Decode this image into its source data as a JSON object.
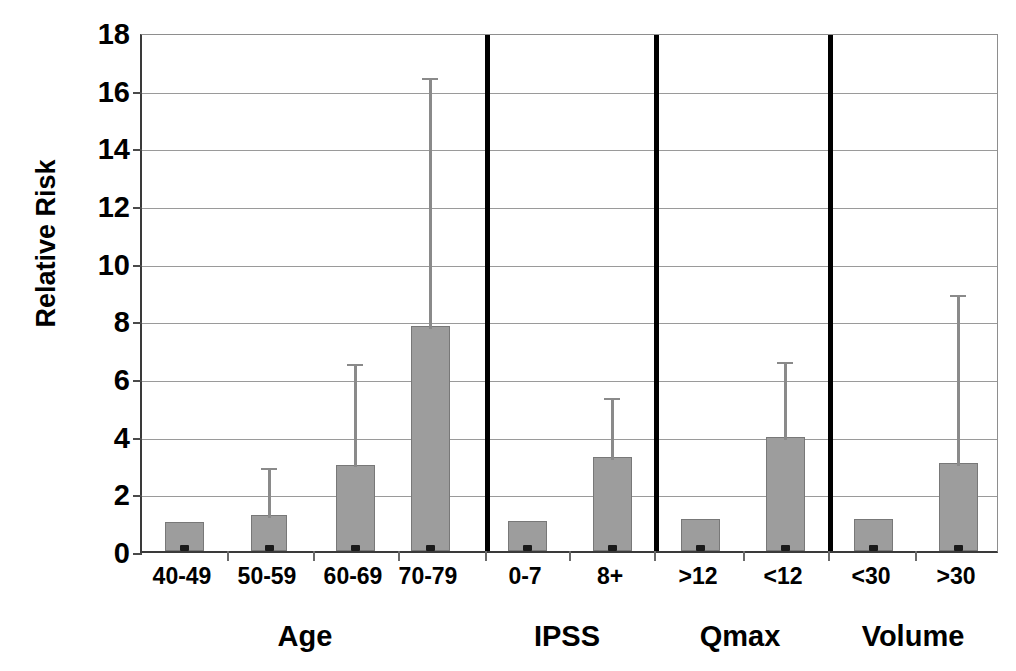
{
  "chart_data": {
    "type": "bar",
    "title": "",
    "subtitle": "",
    "xlabel": "",
    "ylabel": "Relative Risk",
    "ylim": [
      0,
      18
    ],
    "ytick_labels": [
      "0",
      "2",
      "4",
      "6",
      "8",
      "10",
      "12",
      "14",
      "16",
      "18"
    ],
    "ytick_values": [
      0,
      2,
      4,
      6,
      8,
      10,
      12,
      14,
      16,
      18
    ],
    "grid": true,
    "legend": "none",
    "orientation": "vertical",
    "error_bars": "upper 95% confidence interval",
    "categories": [
      "40-49",
      "50-59",
      "60-69",
      "70-79",
      "0-7",
      "8+",
      ">12",
      "<12",
      "<30",
      ">30"
    ],
    "values": [
      1.0,
      1.25,
      3.0,
      7.8,
      1.05,
      3.25,
      1.1,
      3.95,
      1.1,
      3.05
    ],
    "error_upper": [
      1.0,
      3.0,
      6.6,
      16.5,
      1.05,
      5.4,
      1.1,
      6.65,
      1.1,
      9.0
    ],
    "groups": [
      {
        "label": "Age",
        "categories": [
          "40-49",
          "50-59",
          "60-69",
          "70-79"
        ],
        "values": [
          1.0,
          1.25,
          3.0,
          7.8
        ],
        "error_upper": [
          1.0,
          3.0,
          6.6,
          16.5
        ]
      },
      {
        "label": "IPSS",
        "categories": [
          "0-7",
          "8+"
        ],
        "values": [
          1.05,
          3.25
        ],
        "error_upper": [
          1.05,
          5.4
        ]
      },
      {
        "label": "Qmax",
        "categories": [
          ">12",
          "<12"
        ],
        "values": [
          1.1,
          3.95
        ],
        "error_upper": [
          1.1,
          6.65
        ]
      },
      {
        "label": "Volume",
        "categories": [
          "<30",
          ">30"
        ],
        "values": [
          1.1,
          3.05
        ],
        "error_upper": [
          1.1,
          9.0
        ]
      }
    ],
    "colors": {
      "bar_fill": "#9d9d9d",
      "bar_edge": "#787878",
      "error_bar": "#8a8a8a",
      "grid": "#9a9a9a",
      "axis": "#3a3a3a",
      "separator": "#000000",
      "text": "#000000",
      "background": "#ffffff"
    }
  },
  "geometry": {
    "bar_centers_px": [
      182,
      267,
      353,
      428,
      525,
      610,
      698,
      783,
      871,
      956
    ],
    "bar_widths_px": [
      39,
      36,
      39,
      39,
      39,
      39,
      39,
      39,
      39,
      39
    ],
    "separators_px": [
      483,
      652,
      826
    ],
    "xticks_px": [
      225,
      311,
      396,
      483,
      567,
      652,
      741,
      826,
      913
    ],
    "group_label_centers_px": [
      305,
      567,
      740,
      913
    ]
  }
}
